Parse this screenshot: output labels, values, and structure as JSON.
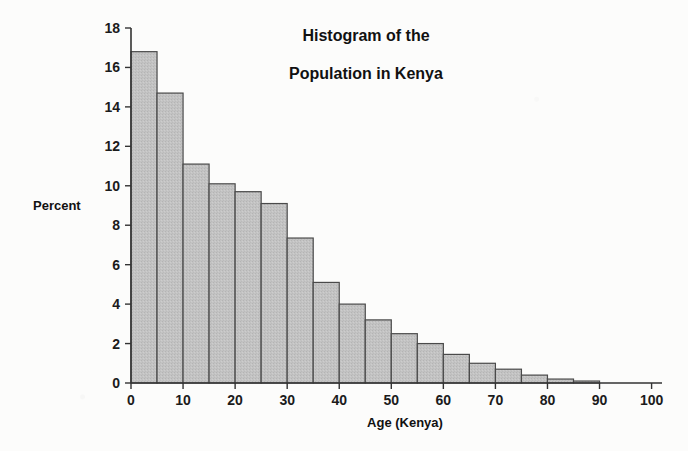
{
  "chart_data": {
    "type": "bar",
    "title": "Histogram of the Population in Kenya",
    "title_line1": "Histogram of the",
    "title_line2": "Population in Kenya",
    "xlabel": "Age (Kenya)",
    "ylabel": "Percent",
    "xlim": [
      0,
      102
    ],
    "ylim": [
      0,
      18
    ],
    "grid": false,
    "legend": null,
    "bin_width": 5,
    "x_ticks": [
      0,
      10,
      20,
      30,
      40,
      50,
      60,
      70,
      80,
      90,
      100
    ],
    "x_tick_labels": [
      "0",
      "10",
      "20",
      "30",
      "40",
      "50",
      "60",
      "70",
      "80",
      "90",
      "100"
    ],
    "y_ticks": [
      0,
      2,
      4,
      6,
      8,
      10,
      12,
      14,
      16,
      18
    ],
    "y_tick_labels": [
      "0",
      "2",
      "4",
      "6",
      "8",
      "10",
      "12",
      "14",
      "16",
      "18"
    ],
    "bin_starts": [
      0,
      5,
      10,
      15,
      20,
      25,
      30,
      35,
      40,
      45,
      50,
      55,
      60,
      65,
      70,
      75,
      80,
      85
    ],
    "categories": [
      "0-5",
      "5-10",
      "10-15",
      "15-20",
      "20-25",
      "25-30",
      "30-35",
      "35-40",
      "40-45",
      "45-50",
      "50-55",
      "55-60",
      "60-65",
      "65-70",
      "70-75",
      "75-80",
      "80-85",
      "85-90"
    ],
    "values": [
      16.8,
      14.7,
      11.1,
      10.1,
      9.7,
      9.1,
      7.35,
      5.1,
      4.0,
      3.2,
      2.5,
      2.0,
      1.45,
      1.0,
      0.7,
      0.4,
      0.2,
      0.1
    ],
    "bar_color": "#c3c3c3",
    "bar_edge_color": "#4a4a4a",
    "axis_color": "#333333",
    "background_color": "#fcfcfb"
  },
  "annotations": {
    "units": "Percent of population",
    "axis_note": ""
  }
}
